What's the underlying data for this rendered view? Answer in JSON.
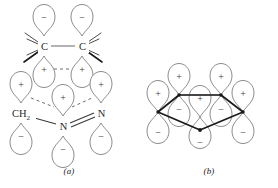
{
  "figure": {
    "colors": {
      "lobe_outline": "#6e6e6e",
      "bond_line": "#3a3a3a",
      "bold_bond": "#1a1a1a",
      "dashed_bond": "#6e6e6e",
      "atom_label": "#2a2a2a",
      "sign_label": "#3a3a3a",
      "background": "#ffffff"
    },
    "panels": [
      {
        "id": "a",
        "caption": "(a)",
        "atoms": [
          {
            "id": "c-left",
            "label": "C",
            "x": 44,
            "y": 46
          },
          {
            "id": "c-right",
            "label": "C",
            "x": 82,
            "y": 46
          },
          {
            "id": "ch2",
            "label": "CH",
            "sub": "2",
            "x": 21,
            "y": 113
          },
          {
            "id": "n-center",
            "label": "N",
            "x": 63,
            "y": 126
          },
          {
            "id": "n-right",
            "label": "N",
            "x": 101,
            "y": 113
          }
        ],
        "lobe_signs": {
          "c-left": {
            "top": "−",
            "bottom": "+"
          },
          "c-right": {
            "top": "−",
            "bottom": "+"
          },
          "ch2": {
            "top": "+",
            "bottom": "−"
          },
          "n-center": {
            "top": "+",
            "bottom": "−"
          },
          "n-right": {
            "top": "+",
            "bottom": "−"
          }
        },
        "bonds": [
          {
            "from": "c-left",
            "to": "c-right",
            "style": "single"
          },
          {
            "from": "ch2",
            "to": "n-center",
            "style": "single"
          },
          {
            "from": "n-center",
            "to": "n-right",
            "style": "double"
          }
        ],
        "overlap_dashes": [
          {
            "from": "c-left-bottom",
            "to": "c-right-bottom"
          },
          {
            "from": "ch2-top",
            "to": "n-center-top"
          },
          {
            "from": "n-center-top",
            "to": "n-right-top"
          }
        ],
        "hash_marks_per_carbon": 4
      },
      {
        "id": "b",
        "caption": "(b)",
        "ring_vertices": 5,
        "top_lobe_sign": "+",
        "bottom_lobe_sign": "−",
        "lobe_count_top": 5,
        "lobe_count_bottom": 5,
        "skeleton": "bold pentagon"
      }
    ],
    "symbols": {
      "plus": "+",
      "minus": "−"
    }
  }
}
